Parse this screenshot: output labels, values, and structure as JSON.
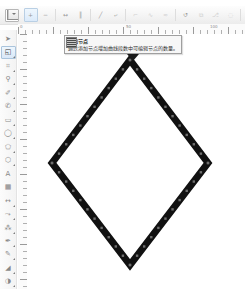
{
  "app": {
    "kind": "vector-graphics-editor"
  },
  "propbar": {
    "name": "node-edit-property-bar",
    "node_type_combo": {
      "value": "",
      "swatch_icon": "node-marker-icon",
      "dropdown_icon": "chevron-down-icon"
    },
    "buttons": [
      {
        "name": "add-node-button",
        "icon": "add-node-icon",
        "state": "hot",
        "glyph": "+"
      },
      {
        "name": "delete-node-button",
        "icon": "delete-node-icon",
        "state": "normal",
        "glyph": "−"
      },
      {
        "name": "join-two-nodes-button",
        "icon": "join-nodes-icon",
        "state": "normal",
        "glyph": "↔"
      },
      {
        "name": "break-curve-button",
        "icon": "break-curve-icon",
        "state": "normal",
        "glyph": "║"
      },
      {
        "name": "convert-to-line-button",
        "icon": "line-segment-icon",
        "state": "normal",
        "glyph": "╱"
      },
      {
        "name": "convert-to-curve-button",
        "icon": "curve-segment-icon",
        "state": "normal",
        "glyph": "⤶"
      },
      {
        "name": "make-node-cusp-button",
        "icon": "cusp-node-icon",
        "state": "dim",
        "glyph": "⌐"
      },
      {
        "name": "make-node-smooth-button",
        "icon": "smooth-node-icon",
        "state": "dim",
        "glyph": "∿"
      },
      {
        "name": "make-node-symmetrical-button",
        "icon": "symmetric-node-icon",
        "state": "dim",
        "glyph": "≈"
      },
      {
        "name": "reverse-direction-button",
        "icon": "reverse-direction-icon",
        "state": "normal",
        "glyph": "↺"
      },
      {
        "name": "extend-curve-to-close-button",
        "icon": "extend-close-icon",
        "state": "dim",
        "glyph": "⧉"
      },
      {
        "name": "extract-subpath-button",
        "icon": "extract-subpath-icon",
        "state": "dim",
        "glyph": "⎇"
      },
      {
        "name": "auto-close-curve-button",
        "icon": "auto-close-icon",
        "state": "dim",
        "glyph": "◌"
      },
      {
        "name": "stretch-scale-nodes-button",
        "icon": "stretch-nodes-icon",
        "state": "dim",
        "glyph": "⤡"
      },
      {
        "name": "rotate-skew-nodes-button",
        "icon": "rotate-nodes-icon",
        "state": "dim",
        "glyph": "↻"
      },
      {
        "name": "align-nodes-button",
        "icon": "align-nodes-icon",
        "state": "dim",
        "glyph": "≡"
      },
      {
        "name": "reflect-nodes-horizontal-button",
        "icon": "reflect-h-icon",
        "state": "dim",
        "glyph": "⇄"
      },
      {
        "name": "elastic-mode-button",
        "icon": "elastic-mode-icon",
        "state": "dim",
        "glyph": "∼"
      },
      {
        "name": "select-all-nodes-button",
        "icon": "select-all-nodes-icon",
        "state": "dim",
        "glyph": "▦"
      },
      {
        "name": "curve-smoothness-slider",
        "icon": "smoothness-slider-icon",
        "state": "dim",
        "glyph": "☰"
      }
    ]
  },
  "tooltip": {
    "name": "add-node-tooltip",
    "title": "添加节点",
    "body": "通过添加节点增加曲线段数中可编辑节点的数量。",
    "button_icon": "add-node-icon"
  },
  "rulers": {
    "unit_corner_icon": "ruler-unit-icon",
    "horizontal_labels": [
      "0",
      "50",
      "100"
    ],
    "vertical_labels": [
      "0",
      "50"
    ]
  },
  "toolbox": {
    "name": "main-toolbox",
    "tools": [
      {
        "name": "tool-pick",
        "icon": "pick-arrow-icon",
        "selected": false,
        "flyout": false
      },
      {
        "name": "tool-shape-edit",
        "icon": "shape-node-edit-icon",
        "selected": true,
        "flyout": true
      },
      {
        "name": "tool-crop",
        "icon": "crop-icon",
        "selected": false,
        "flyout": true
      },
      {
        "name": "tool-zoom",
        "icon": "magnifier-icon",
        "selected": false,
        "flyout": true
      },
      {
        "name": "tool-freehand",
        "icon": "freehand-pencil-icon",
        "selected": false,
        "flyout": true
      },
      {
        "name": "tool-smart-fill",
        "icon": "smart-fill-icon",
        "selected": false,
        "flyout": true
      },
      {
        "name": "tool-rectangle",
        "icon": "rectangle-icon",
        "selected": false,
        "flyout": true
      },
      {
        "name": "tool-ellipse",
        "icon": "ellipse-icon",
        "selected": false,
        "flyout": true
      },
      {
        "name": "tool-polygon",
        "icon": "polygon-icon",
        "selected": false,
        "flyout": true
      },
      {
        "name": "tool-basic-shapes",
        "icon": "basic-shapes-icon",
        "selected": false,
        "flyout": true
      },
      {
        "name": "tool-text",
        "icon": "text-tool-icon",
        "selected": false,
        "flyout": false
      },
      {
        "name": "tool-table",
        "icon": "table-icon",
        "selected": false,
        "flyout": false
      },
      {
        "name": "tool-dimension",
        "icon": "dimension-line-icon",
        "selected": false,
        "flyout": true
      },
      {
        "name": "tool-connector",
        "icon": "connector-icon",
        "selected": false,
        "flyout": true
      },
      {
        "name": "tool-blend",
        "icon": "blend-effect-icon",
        "selected": false,
        "flyout": true
      },
      {
        "name": "tool-color-eyedropper",
        "icon": "eyedropper-icon",
        "selected": false,
        "flyout": true
      },
      {
        "name": "tool-outline",
        "icon": "outline-pen-icon",
        "selected": false,
        "flyout": true
      },
      {
        "name": "tool-fill",
        "icon": "fill-bucket-icon",
        "selected": false,
        "flyout": true
      },
      {
        "name": "tool-interactive-fill",
        "icon": "interactive-fill-icon",
        "selected": false,
        "flyout": true
      }
    ]
  },
  "canvas": {
    "name": "drawing-canvas",
    "background": "#ffffff",
    "shape": {
      "name": "diamond-path",
      "type": "closed-polygon",
      "stroke_color": "#111111",
      "stroke_width": 7,
      "fill": "none",
      "vertices": [
        {
          "x": 103,
          "y": 26
        },
        {
          "x": 181,
          "y": 129
        },
        {
          "x": 103,
          "y": 231
        },
        {
          "x": 25,
          "y": 129
        }
      ],
      "node_marker": {
        "icon": "node-square-icon",
        "color": "#6e6e6e",
        "size": 2.4,
        "count_per_edge": 11
      }
    }
  }
}
